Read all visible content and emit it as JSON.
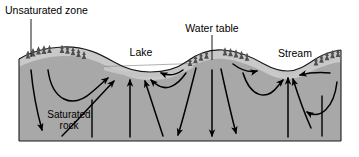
{
  "figure": {
    "type": "cross-section-diagram",
    "width": 359,
    "height": 157
  },
  "labels": {
    "unsaturated_zone": "Unsaturated zone",
    "water_table": "Water table",
    "lake": "Lake",
    "stream": "Stream",
    "saturated_rock_line1": "Saturated",
    "saturated_rock_line2": "rock"
  },
  "colors": {
    "unsaturated_fill": "#c9c9c9",
    "saturated_fill": "#a8a8a8",
    "water_fill": "#c4c4c4",
    "outline": "#1a1a1a",
    "arrow": "#000000",
    "background": "#ffffff",
    "tree": "#4a4a4a"
  },
  "features": [
    {
      "name": "hill-left",
      "kind": "upland"
    },
    {
      "name": "lake-basin",
      "kind": "surface-water"
    },
    {
      "name": "hill-center",
      "kind": "upland"
    },
    {
      "name": "stream-channel",
      "kind": "surface-water"
    },
    {
      "name": "hill-right",
      "kind": "upland"
    }
  ],
  "flow_arrows": {
    "count": 18,
    "description": "Groundwater flow paths from recharge areas beneath hills toward discharge at lake and stream"
  },
  "leader_lines": {
    "unsaturated_zone": "vertical leader from label down to unsaturated zone on left hill",
    "water_table": "vertical leader from label down through center hill to base"
  }
}
